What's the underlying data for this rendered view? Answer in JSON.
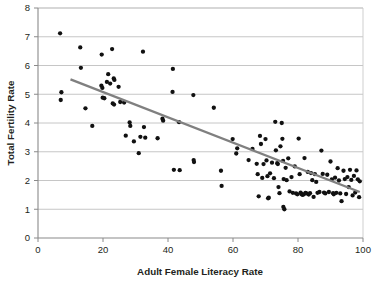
{
  "chart_data": {
    "type": "scatter",
    "title": "",
    "subtitle": "",
    "xlabel": "Adult Female Literacy Rate",
    "ylabel": "Total Fertility Rate",
    "xlim": [
      0,
      100
    ],
    "ylim": [
      0,
      8
    ],
    "xticks": [
      0,
      20,
      40,
      60,
      80,
      100
    ],
    "yticks": [
      0,
      1,
      2,
      3,
      4,
      5,
      6,
      7,
      8
    ],
    "xtick_labels": [
      "0",
      "20",
      "40",
      "60",
      "80",
      "100"
    ],
    "ytick_labels": [
      "0",
      "1",
      "2",
      "3",
      "4",
      "5",
      "6",
      "7",
      "8"
    ],
    "grid": {
      "horizontal": true,
      "vertical": false,
      "color": "#bfbfbf"
    },
    "legend": {
      "visible": false,
      "position": "none",
      "entries": []
    },
    "marker": {
      "shape": "circle",
      "color": "#111111",
      "size": 4.3
    },
    "series": [
      {
        "name": "Countries",
        "type": "scatter",
        "color": "#111111",
        "points": [
          [
            6.8,
            7.12
          ],
          [
            7.2,
            5.07
          ],
          [
            7.0,
            4.8
          ],
          [
            13.0,
            6.63
          ],
          [
            13.2,
            5.92
          ],
          [
            14.6,
            4.51
          ],
          [
            16.7,
            3.9
          ],
          [
            19.6,
            6.38
          ],
          [
            19.5,
            5.3
          ],
          [
            19.8,
            5.22
          ],
          [
            19.9,
            4.88
          ],
          [
            20.4,
            4.86
          ],
          [
            21.2,
            5.43
          ],
          [
            21.6,
            5.7
          ],
          [
            22.2,
            5.37
          ],
          [
            22.8,
            6.57
          ],
          [
            23.3,
            5.55
          ],
          [
            23.5,
            5.5
          ],
          [
            23.0,
            4.68
          ],
          [
            23.4,
            4.64
          ],
          [
            24.8,
            5.26
          ],
          [
            25.3,
            4.73
          ],
          [
            26.5,
            4.71
          ],
          [
            27.0,
            3.56
          ],
          [
            28.2,
            4.02
          ],
          [
            28.4,
            3.9
          ],
          [
            29.5,
            3.36
          ],
          [
            31.0,
            2.95
          ],
          [
            31.5,
            3.52
          ],
          [
            32.3,
            6.48
          ],
          [
            32.6,
            3.86
          ],
          [
            33.0,
            3.49
          ],
          [
            36.8,
            3.47
          ],
          [
            38.3,
            4.15
          ],
          [
            38.5,
            4.08
          ],
          [
            41.5,
            5.88
          ],
          [
            41.4,
            5.08
          ],
          [
            41.8,
            2.37
          ],
          [
            43.4,
            4.03
          ],
          [
            43.6,
            2.36
          ],
          [
            47.8,
            4.97
          ],
          [
            47.9,
            2.71
          ],
          [
            48.0,
            2.64
          ],
          [
            54.1,
            4.53
          ],
          [
            56.3,
            2.34
          ],
          [
            56.5,
            1.81
          ],
          [
            59.9,
            3.44
          ],
          [
            61.0,
            2.94
          ],
          [
            61.3,
            3.12
          ],
          [
            64.8,
            2.71
          ],
          [
            66.0,
            3.1
          ],
          [
            67.3,
            2.58
          ],
          [
            67.6,
            2.22
          ],
          [
            67.9,
            1.45
          ],
          [
            68.3,
            3.55
          ],
          [
            68.6,
            3.27
          ],
          [
            69.0,
            2.09
          ],
          [
            69.4,
            2.57
          ],
          [
            70.0,
            3.44
          ],
          [
            70.3,
            2.7
          ],
          [
            70.6,
            2.15
          ],
          [
            70.8,
            1.38
          ],
          [
            71.0,
            1.4
          ],
          [
            71.4,
            2.25
          ],
          [
            72.0,
            2.62
          ],
          [
            72.6,
            2.08
          ],
          [
            73.0,
            4.04
          ],
          [
            73.2,
            3.05
          ],
          [
            73.6,
            2.6
          ],
          [
            73.8,
            2.57
          ],
          [
            74.0,
            1.77
          ],
          [
            74.3,
            1.56
          ],
          [
            74.6,
            3.19
          ],
          [
            75.0,
            4.0
          ],
          [
            75.2,
            3.45
          ],
          [
            75.4,
            2.68
          ],
          [
            75.6,
            2.05
          ],
          [
            75.5,
            1.08
          ],
          [
            75.8,
            1.0
          ],
          [
            76.2,
            2.44
          ],
          [
            76.5,
            2.01
          ],
          [
            77.0,
            2.77
          ],
          [
            77.4,
            1.62
          ],
          [
            78.0,
            2.12
          ],
          [
            78.4,
            1.57
          ],
          [
            79.0,
            2.49
          ],
          [
            79.4,
            1.55
          ],
          [
            79.8,
            1.52
          ],
          [
            80.2,
            3.46
          ],
          [
            80.5,
            2.22
          ],
          [
            80.8,
            1.58
          ],
          [
            81.0,
            1.53
          ],
          [
            81.4,
            1.5
          ],
          [
            81.8,
            1.52
          ],
          [
            82.0,
            2.78
          ],
          [
            82.3,
            1.57
          ],
          [
            82.6,
            1.55
          ],
          [
            83.0,
            2.3
          ],
          [
            83.3,
            1.51
          ],
          [
            83.7,
            1.56
          ],
          [
            84.0,
            2.26
          ],
          [
            84.4,
            2.01
          ],
          [
            84.8,
            1.43
          ],
          [
            85.2,
            2.22
          ],
          [
            85.6,
            1.95
          ],
          [
            86.0,
            1.57
          ],
          [
            86.6,
            1.6
          ],
          [
            87.2,
            3.04
          ],
          [
            87.6,
            2.23
          ],
          [
            88.0,
            1.58
          ],
          [
            88.4,
            1.55
          ],
          [
            89.0,
            2.2
          ],
          [
            89.5,
            1.6
          ],
          [
            90.0,
            2.66
          ],
          [
            90.4,
            2.04
          ],
          [
            90.8,
            1.56
          ],
          [
            91.0,
            1.52
          ],
          [
            91.4,
            2.1
          ],
          [
            91.8,
            1.57
          ],
          [
            92.2,
            2.43
          ],
          [
            92.6,
            2.0
          ],
          [
            93.0,
            1.55
          ],
          [
            93.4,
            1.28
          ],
          [
            94.0,
            2.34
          ],
          [
            94.4,
            2.05
          ],
          [
            94.8,
            1.53
          ],
          [
            95.2,
            2.12
          ],
          [
            95.6,
            1.77
          ],
          [
            96.0,
            2.37
          ],
          [
            96.4,
            2.02
          ],
          [
            96.8,
            1.48
          ],
          [
            97.2,
            2.16
          ],
          [
            97.6,
            1.58
          ],
          [
            98.0,
            2.35
          ],
          [
            98.4,
            2.04
          ],
          [
            98.8,
            1.42
          ],
          [
            99.0,
            1.97
          ]
        ]
      }
    ],
    "trendline": {
      "name": "linear-fit",
      "type": "line",
      "color": "#808080",
      "x_start": 10.0,
      "y_start": 5.52,
      "x_end": 99.0,
      "y_end": 1.6
    }
  }
}
